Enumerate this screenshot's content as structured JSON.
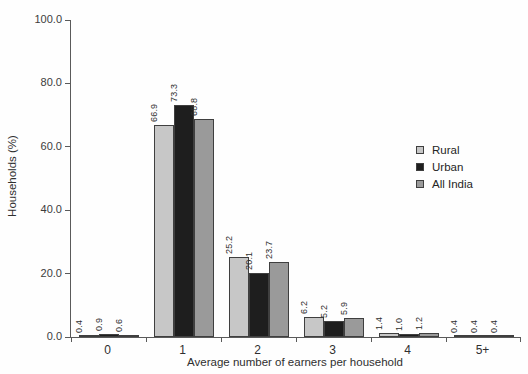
{
  "chart_data": {
    "type": "bar",
    "title": "",
    "categories": [
      "0",
      "1",
      "2",
      "3",
      "4",
      "5+"
    ],
    "series": [
      {
        "name": "Rural",
        "color": "#c7c7c7",
        "values": [
          0.4,
          66.9,
          25.2,
          6.2,
          1.4,
          0.4
        ]
      },
      {
        "name": "Urban",
        "color": "#1e1e1e",
        "values": [
          0.9,
          73.3,
          20.1,
          5.2,
          1.0,
          0.4
        ]
      },
      {
        "name": "All India",
        "color": "#9a9a9a",
        "values": [
          0.6,
          68.8,
          23.7,
          5.9,
          1.2,
          0.4
        ]
      }
    ],
    "xlabel": "Average number of earners per household",
    "ylabel": "Households (%)",
    "ylim": [
      0,
      100
    ],
    "yticks": [
      0,
      20,
      40,
      60,
      80,
      100
    ],
    "ytick_labels": [
      "0.0",
      "20.0",
      "40.0",
      "60.0",
      "80.0",
      "100.0"
    ],
    "grid": false,
    "bar_labels": true,
    "bar_label_format": "one_decimal",
    "legend_position": "right-middle",
    "axis_color": "#5a5a5a"
  }
}
